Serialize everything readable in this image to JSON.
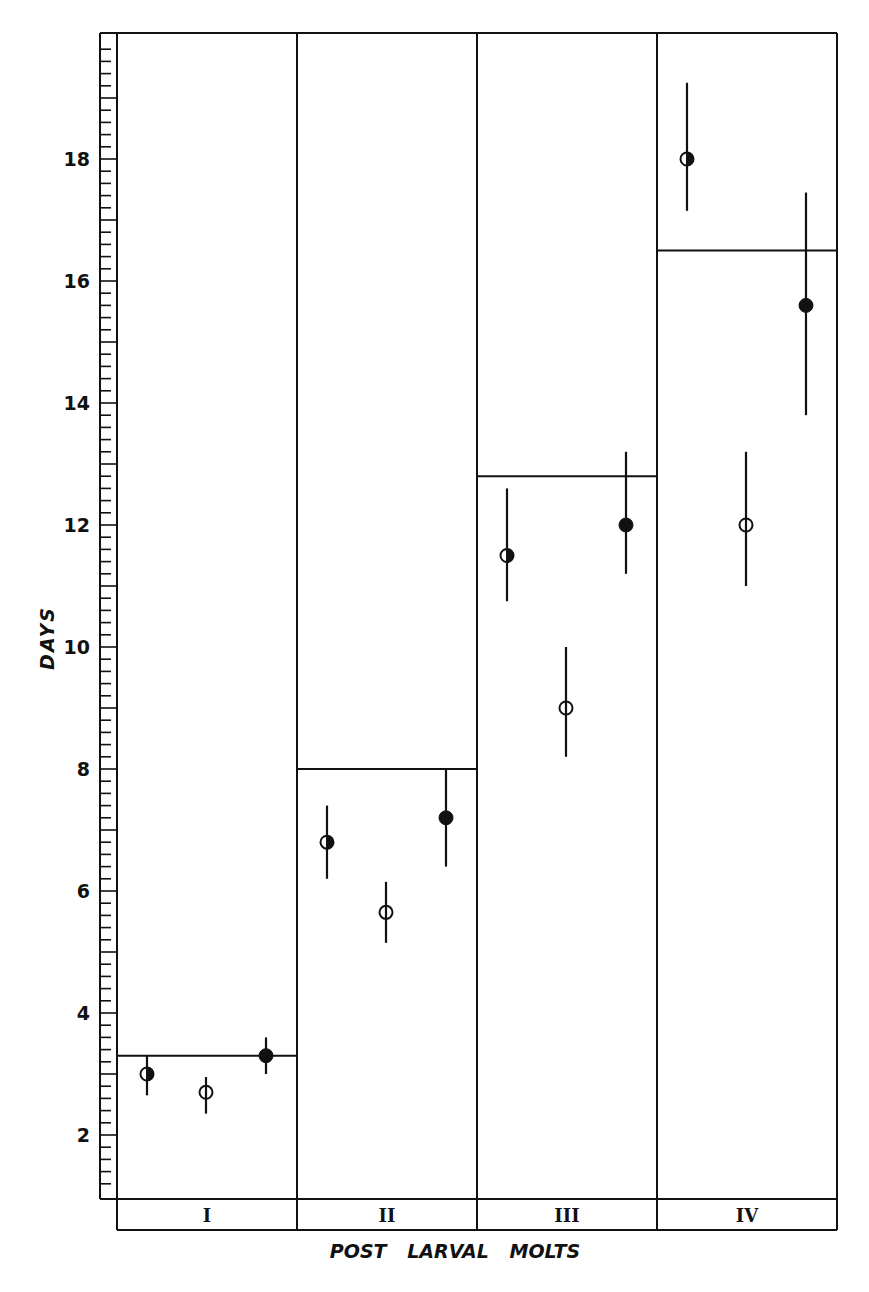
{
  "chart_data": {
    "type": "scatter",
    "title": "",
    "xlabel": "POST LARVAL MOLTS",
    "ylabel": "DAYS",
    "ylim": [
      1,
      20
    ],
    "yticks_major_labeled": [
      2,
      4,
      6,
      8,
      10,
      12,
      14,
      16,
      18
    ],
    "ytick_minor_step": 0.2,
    "ytick_major_step": 1,
    "grid": false,
    "legend": null,
    "categories": [
      "I",
      "II",
      "III",
      "IV"
    ],
    "panel_reference_lines": [
      3.3,
      8.0,
      12.8,
      16.5
    ],
    "series": [
      {
        "name": "half-filled circle",
        "marker": "half-filled",
        "values": [
          3.0,
          6.8,
          11.5,
          18.0
        ],
        "err_low": [
          2.65,
          6.2,
          10.75,
          17.15
        ],
        "err_high": [
          3.3,
          7.4,
          12.6,
          19.25
        ]
      },
      {
        "name": "open circle",
        "marker": "open",
        "values": [
          2.7,
          5.65,
          9.0,
          12.0
        ],
        "err_low": [
          2.35,
          5.15,
          8.2,
          11.0
        ],
        "err_high": [
          2.95,
          6.15,
          10.0,
          13.2
        ]
      },
      {
        "name": "filled circle",
        "marker": "filled",
        "values": [
          3.3,
          7.2,
          12.0,
          15.6
        ],
        "err_low": [
          3.0,
          6.4,
          11.2,
          13.8
        ],
        "err_high": [
          3.6,
          8.0,
          13.2,
          17.45
        ]
      }
    ]
  },
  "axis": {
    "y_label": "DAYS",
    "x_label": "POST LARVAL MOLTS",
    "y_tick_labels": [
      "2",
      "4",
      "6",
      "8",
      "10",
      "12",
      "14",
      "16",
      "18"
    ]
  },
  "caption_fragment": "Fig. — Time of molt intervals for post-larval stages (caption cut off)",
  "colors": {
    "ink": "#111111",
    "paper": "#ffffff"
  }
}
